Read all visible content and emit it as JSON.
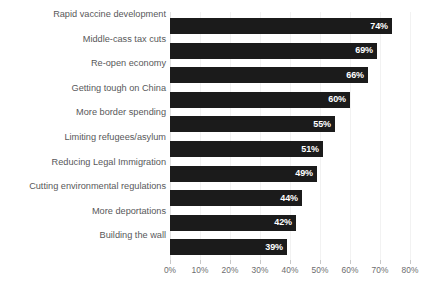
{
  "chart_data": {
    "type": "bar",
    "orientation": "horizontal",
    "title": "",
    "subtitle": "",
    "xlabel": "",
    "ylabel": "",
    "xlim": [
      0,
      80
    ],
    "grid": true,
    "legend": null,
    "legend_position": "none",
    "value_label_suffix": "%",
    "categories": [
      "Rapid vaccine development",
      "Middle-cass tax cuts",
      "Re-open economy",
      "Getting tough on China",
      "More border spending",
      "Limiting refugees/asylum",
      "Reducing Legal Immigration",
      "Cutting environmental regulations",
      "More deportations",
      "Building the wall"
    ],
    "values": [
      74,
      69,
      66,
      60,
      55,
      51,
      49,
      44,
      42,
      39
    ],
    "value_labels": [
      "74%",
      "69%",
      "66%",
      "60%",
      "55%",
      "51%",
      "49%",
      "44%",
      "42%",
      "39%"
    ],
    "xticks": [
      0,
      10,
      20,
      30,
      40,
      50,
      60,
      70,
      80
    ],
    "xtick_labels": [
      "0%",
      "10%",
      "20%",
      "30%",
      "40%",
      "50%",
      "60%",
      "70%",
      "80%"
    ],
    "colors": {
      "bar": "#1b1b1b",
      "value_text": "#ffffff",
      "category_text": "#58585a",
      "tick_text": "#6d6d6f",
      "gridline": "#f2f2f2",
      "axis": "#e2e2e2",
      "background": "#ffffff"
    }
  }
}
